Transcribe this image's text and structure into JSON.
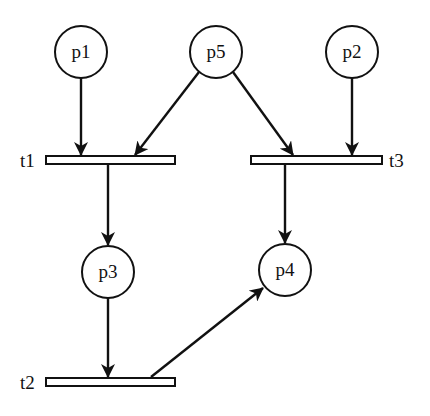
{
  "diagram": {
    "type": "petri-net",
    "places": [
      {
        "id": "p1",
        "label": "p1",
        "cx": 81,
        "cy": 52
      },
      {
        "id": "p5",
        "label": "p5",
        "cx": 216,
        "cy": 52
      },
      {
        "id": "p2",
        "label": "p2",
        "cx": 352,
        "cy": 52
      },
      {
        "id": "p3",
        "label": "p3",
        "cx": 108,
        "cy": 272
      },
      {
        "id": "p4",
        "label": "p4",
        "cx": 285,
        "cy": 270
      }
    ],
    "transitions": [
      {
        "id": "t1",
        "label": "t1"
      },
      {
        "id": "t3",
        "label": "t3"
      },
      {
        "id": "t2",
        "label": "t2"
      }
    ],
    "arcs": [
      {
        "from": "p1",
        "to": "t1"
      },
      {
        "from": "p5",
        "to": "t1"
      },
      {
        "from": "p5",
        "to": "t3"
      },
      {
        "from": "p2",
        "to": "t3"
      },
      {
        "from": "t1",
        "to": "p3"
      },
      {
        "from": "t3",
        "to": "p4"
      },
      {
        "from": "p3",
        "to": "t2"
      },
      {
        "from": "t2",
        "to": "p4"
      }
    ]
  }
}
